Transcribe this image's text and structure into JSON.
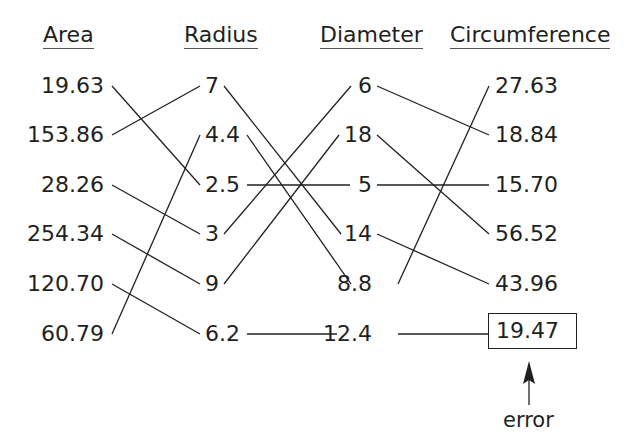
{
  "headers": {
    "area": "Area",
    "radius": "Radius",
    "diameter": "Diameter",
    "circumference": "Circumference"
  },
  "columns": {
    "area": [
      "19.63",
      "153.86",
      "28.26",
      "254.34",
      "120.70",
      "60.79"
    ],
    "radius": [
      "7",
      "4.4",
      "2.5",
      "3",
      "9",
      "6.2"
    ],
    "diameter": [
      "6",
      "18",
      "5",
      "14",
      "8.8",
      "12.4"
    ],
    "circumference": [
      "27.63",
      "18.84",
      "15.70",
      "56.52",
      "43.96",
      "19.47"
    ]
  },
  "connections": {
    "area_to_radius": [
      {
        "from": "19.63",
        "to": "2.5"
      },
      {
        "from": "153.86",
        "to": "7"
      },
      {
        "from": "28.26",
        "to": "3"
      },
      {
        "from": "254.34",
        "to": "9"
      },
      {
        "from": "120.70",
        "to": "6.2"
      },
      {
        "from": "60.79",
        "to": "4.4"
      }
    ],
    "radius_to_diameter": [
      {
        "from": "7",
        "to": "14"
      },
      {
        "from": "4.4",
        "to": "8.8"
      },
      {
        "from": "2.5",
        "to": "5"
      },
      {
        "from": "3",
        "to": "6"
      },
      {
        "from": "9",
        "to": "18"
      },
      {
        "from": "6.2",
        "to": "12.4"
      }
    ],
    "diameter_to_circumference": [
      {
        "from": "6",
        "to": "18.84"
      },
      {
        "from": "18",
        "to": "56.52"
      },
      {
        "from": "5",
        "to": "15.70"
      },
      {
        "from": "14",
        "to": "43.96"
      },
      {
        "from": "8.8",
        "to": "27.63"
      },
      {
        "from": "12.4",
        "to": "19.47"
      }
    ]
  },
  "annotation": {
    "highlighted_value": "19.47",
    "label": "error"
  }
}
